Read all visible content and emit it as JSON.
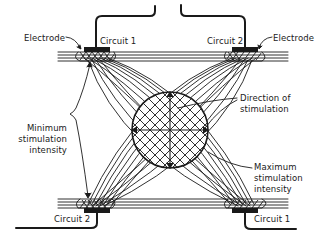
{
  "diagram": {
    "labels": {
      "electrode_left": "Electrode",
      "electrode_right": "Electrode",
      "circuit1_top": "Circuit 1",
      "circuit2_top": "Circuit 2",
      "circuit2_bottom": "Circuit 2",
      "circuit1_bottom": "Circuit 1",
      "min_line1": "Minimum",
      "min_line2": "stimulation",
      "min_line3": "intensity",
      "dir_line1": "Direction of",
      "dir_line2": "stimulation",
      "max_line1": "Maximum",
      "max_line2": "stimulation",
      "max_line3": "intensity"
    },
    "elements": {
      "electrodes": 4,
      "circuits": [
        "Circuit 1",
        "Circuit 2"
      ],
      "interference_zone": "circle with crosshatch and directional axes"
    },
    "colors": {
      "ink": "#1a1a1a",
      "background": "#ffffff"
    }
  }
}
